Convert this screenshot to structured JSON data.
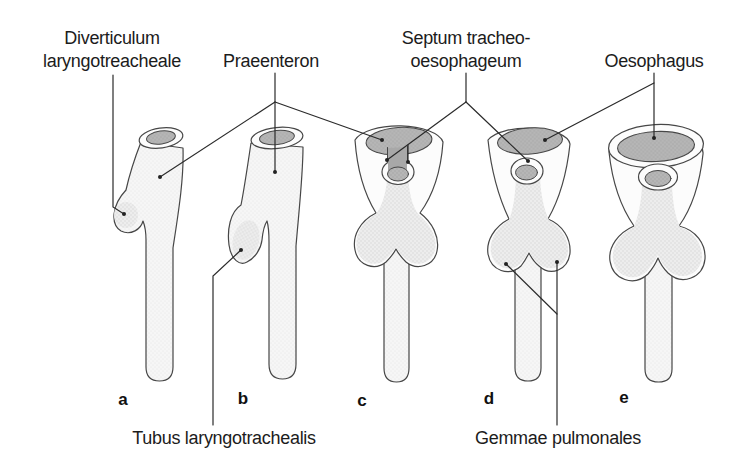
{
  "labels": {
    "diverticulum": {
      "line1": "Diverticulum",
      "line2": "laryngotreacheale"
    },
    "praeenteron": {
      "text": "Praeenteron"
    },
    "septum": {
      "line1": "Septum tracheo-",
      "line2": "oesophageum"
    },
    "oesophagus": {
      "text": "Oesophagus"
    },
    "tubus_laryngotrachealis": {
      "text": "Tubus laryngotrachealis"
    },
    "gemmae_pulmonales": {
      "text": "Gemmae pulmonales"
    }
  },
  "stages": [
    {
      "letter": "a"
    },
    {
      "letter": "b"
    },
    {
      "letter": "c"
    },
    {
      "letter": "d"
    },
    {
      "letter": "e"
    }
  ],
  "colors": {
    "background": "#ffffff",
    "text": "#1c1c1c",
    "leader_line": "#2b2b2b",
    "outline": "#474747",
    "wall": "#fcfcfc",
    "body_light": "#f6f6f6",
    "body_mid": "#ededed",
    "lumen": "#b6b6b6"
  }
}
